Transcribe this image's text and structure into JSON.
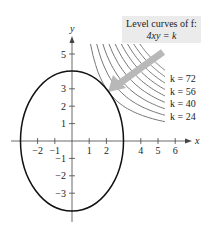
{
  "chart_data": {
    "type": "line",
    "title": "Level curves of f: 4xy = k",
    "xlabel": "x",
    "ylabel": "y",
    "xlim": [
      -3.6,
      7
    ],
    "ylim": [
      -4.5,
      6
    ],
    "x_ticks": [
      -2,
      -1,
      1,
      2,
      4,
      5,
      6
    ],
    "y_ticks": [
      5,
      3,
      2,
      1,
      -1,
      -2,
      -3
    ],
    "grid": false,
    "series": [
      {
        "name": "Constraint ellipse",
        "equation": "x^2/9 + y^2/16 = 1",
        "a": 3,
        "b": 4,
        "color": "#111111"
      },
      {
        "name": "Level curves",
        "equation": "4xy = k",
        "k_values": [
          24,
          32,
          40,
          48,
          56,
          64,
          72,
          80,
          88
        ],
        "labeled_k": [
          72,
          56,
          40,
          24
        ],
        "color": "#777777"
      }
    ],
    "annotations": [
      {
        "text": "Level curves of f:",
        "line2": "4xy = k",
        "position": "top-right"
      },
      {
        "type": "arrow",
        "from": [
          5.4,
          5.2
        ],
        "to": [
          2.2,
          2.9
        ],
        "color": "#b5b5b5",
        "meaning": "direction of decreasing k toward tangency"
      }
    ],
    "labels": [
      {
        "text": "k = 72"
      },
      {
        "text": "k = 56"
      },
      {
        "text": "k = 40"
      },
      {
        "text": "k = 24"
      }
    ]
  },
  "title_box": {
    "line1": "Level curves of f:",
    "line2": "4xy = k"
  },
  "axes": {
    "x_label": "x",
    "y_label": "y",
    "x_tick_labels": [
      "−2",
      "−1",
      "1",
      "2",
      "4",
      "5",
      "6"
    ],
    "y_tick_labels": [
      "5",
      "3",
      "2",
      "1",
      "−1",
      "−2",
      "−3"
    ]
  },
  "curve_labels": [
    "k = 72",
    "k = 56",
    "k = 40",
    "k = 24"
  ],
  "colors": {
    "ellipse": "#111111",
    "level_curve": "#7a7a7a",
    "arrow": "#b8b8b8",
    "box_bg": "#ebebeb",
    "axis": "#444444"
  }
}
